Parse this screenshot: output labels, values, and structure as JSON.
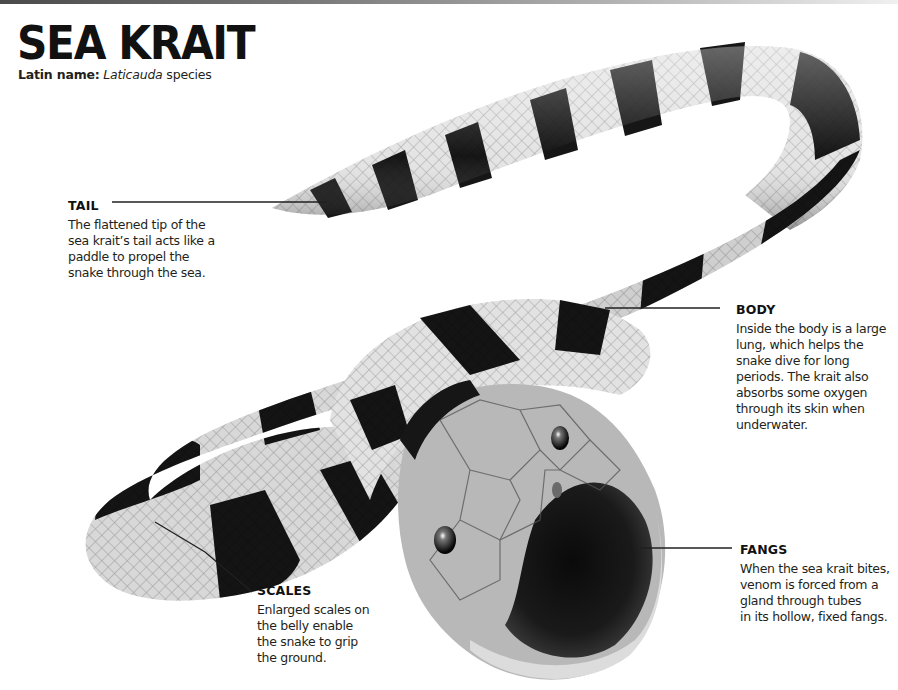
{
  "header": {
    "title": "SEA KRAIT",
    "latin_label": "Latin name:",
    "latin_genus": "Laticauda",
    "latin_suffix": " species"
  },
  "illustration": {
    "subject": "sea krait snake, banded black and white, coiled with mouth open",
    "colors": {
      "dark_band": "#141414",
      "light_band": "#e6e6e6",
      "mid_tone": "#8a8a8a",
      "leader_line": "#231f20"
    }
  },
  "callouts": {
    "tail": {
      "heading": "TAIL",
      "body": "The flattened tip of the\nsea krait’s tail acts like a\npaddle to propel the\nsnake through the sea."
    },
    "body": {
      "heading": "BODY",
      "body": "Inside the body is a large\nlung, which helps the\nsnake dive for long\nperiods. The krait also\nabsorbs some oxygen\nthrough its skin when\nunderwater."
    },
    "fangs": {
      "heading": "FANGS",
      "body": "When the sea krait bites,\nvenom is forced from a\ngland through tubes\nin its hollow, fixed fangs."
    },
    "scales": {
      "heading": "SCALES",
      "body": "Enlarged scales on\nthe belly enable\nthe snake to grip\nthe ground."
    }
  }
}
